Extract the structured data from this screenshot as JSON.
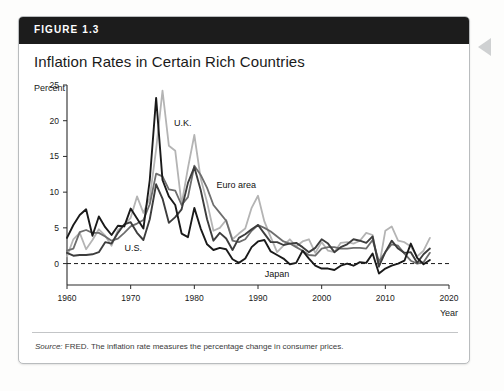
{
  "figure": {
    "label": "FIGURE 1.3",
    "title": "Inflation Rates in Certain Rich Countries",
    "source_prefix": "Source:",
    "source_text": "FRED. The inflation rate measures the percentage change in consumer prices.",
    "band_color": "#1c1c1c"
  },
  "bleed_text": "and some negative text",
  "chart_data": {
    "type": "line",
    "title": "Inflation Rates in Certain Rich Countries",
    "ylabel": "Percent",
    "xlabel": "Year",
    "xlim": [
      1960,
      2020
    ],
    "ylim": [
      -3,
      25
    ],
    "yticks": [
      0,
      5,
      10,
      15,
      20,
      25
    ],
    "xticks": [
      1960,
      1970,
      1980,
      1990,
      2000,
      2010,
      2020
    ],
    "grid": false,
    "zero_line": true,
    "zero_line_style": "dashed",
    "legend_position": "inline-annotations",
    "x": [
      1960,
      1961,
      1962,
      1963,
      1964,
      1965,
      1966,
      1967,
      1968,
      1969,
      1970,
      1971,
      1972,
      1973,
      1974,
      1975,
      1976,
      1977,
      1978,
      1979,
      1980,
      1981,
      1982,
      1983,
      1984,
      1985,
      1986,
      1987,
      1988,
      1989,
      1990,
      1991,
      1992,
      1993,
      1994,
      1995,
      1996,
      1997,
      1998,
      1999,
      2000,
      2001,
      2002,
      2003,
      2004,
      2005,
      2006,
      2007,
      2008,
      2009,
      2010,
      2011,
      2012,
      2013,
      2014,
      2015,
      2016,
      2017
    ],
    "series": [
      {
        "name": "U.K.",
        "color": "#b4b4b4",
        "width": 1.8,
        "values": [
          1.0,
          3.4,
          4.3,
          2.0,
          3.3,
          4.8,
          3.9,
          2.5,
          4.7,
          5.4,
          6.4,
          9.4,
          7.1,
          9.2,
          16.0,
          24.2,
          16.5,
          15.8,
          8.3,
          13.4,
          18.0,
          11.9,
          8.6,
          4.6,
          5.0,
          6.1,
          3.4,
          4.2,
          4.9,
          7.8,
          9.5,
          5.9,
          3.7,
          1.6,
          2.5,
          3.4,
          2.4,
          3.1,
          3.4,
          1.5,
          3.0,
          1.8,
          1.6,
          2.9,
          3.0,
          2.8,
          3.2,
          4.3,
          4.0,
          -0.5,
          4.6,
          5.2,
          3.2,
          3.0,
          2.4,
          1.0,
          1.8,
          3.6
        ]
      },
      {
        "name": "Japan",
        "color": "#1a1a1a",
        "width": 1.9,
        "values": [
          3.6,
          5.4,
          6.8,
          7.6,
          3.9,
          6.6,
          5.1,
          4.0,
          5.3,
          5.2,
          7.7,
          6.3,
          4.9,
          11.7,
          23.2,
          11.7,
          9.4,
          8.2,
          4.2,
          3.7,
          7.8,
          4.9,
          2.7,
          1.9,
          2.2,
          2.0,
          0.6,
          0.1,
          0.7,
          2.3,
          3.1,
          3.3,
          1.7,
          1.2,
          0.7,
          -0.1,
          0.1,
          1.8,
          0.7,
          -0.3,
          -0.7,
          -0.7,
          -0.9,
          -0.3,
          0.0,
          -0.3,
          0.2,
          0.1,
          1.4,
          -1.4,
          -0.7,
          -0.3,
          0.0,
          0.4,
          2.8,
          0.8,
          -0.1,
          0.5
        ]
      },
      {
        "name": "Euro area",
        "color": "#6e6e6e",
        "width": 1.8,
        "values": [
          1.8,
          2.1,
          4.4,
          4.7,
          4.3,
          4.3,
          3.8,
          3.2,
          3.5,
          4.3,
          5.2,
          5.6,
          6.1,
          8.3,
          12.6,
          12.2,
          10.4,
          10.2,
          8.2,
          9.3,
          13.7,
          12.4,
          10.6,
          8.2,
          7.1,
          6.0,
          3.2,
          3.0,
          3.4,
          4.6,
          5.4,
          5.0,
          4.5,
          3.8,
          3.1,
          2.8,
          2.3,
          1.8,
          1.2,
          1.1,
          2.1,
          2.3,
          2.3,
          2.1,
          2.1,
          2.2,
          2.2,
          2.1,
          3.3,
          0.3,
          1.6,
          2.7,
          2.5,
          1.4,
          0.4,
          0.0,
          0.2,
          1.5
        ]
      },
      {
        "name": "U.S.",
        "color": "#3d3d3d",
        "width": 1.9,
        "values": [
          1.5,
          1.1,
          1.2,
          1.2,
          1.3,
          1.6,
          3.0,
          2.8,
          4.3,
          5.5,
          5.8,
          4.3,
          3.3,
          6.2,
          11.1,
          9.1,
          5.7,
          6.5,
          7.6,
          11.3,
          13.5,
          10.3,
          6.2,
          3.2,
          4.3,
          3.5,
          1.9,
          3.6,
          4.1,
          4.8,
          5.4,
          4.2,
          3.0,
          3.0,
          2.6,
          2.8,
          2.9,
          2.3,
          1.6,
          2.2,
          3.4,
          2.8,
          1.6,
          2.3,
          2.7,
          3.4,
          3.2,
          2.9,
          3.8,
          -0.4,
          1.6,
          3.2,
          2.1,
          1.5,
          1.6,
          0.1,
          1.3,
          2.1
        ]
      }
    ],
    "annotations": [
      {
        "text": "U.K.",
        "x": 1978.2,
        "y": 19.2
      },
      {
        "text": "Euro area",
        "x": 1986.6,
        "y": 10.6
      },
      {
        "text": "U.S.",
        "x": 1970.4,
        "y": 1.7
      },
      {
        "text": "Japan",
        "x": 1993.0,
        "y": -1.9
      }
    ]
  }
}
